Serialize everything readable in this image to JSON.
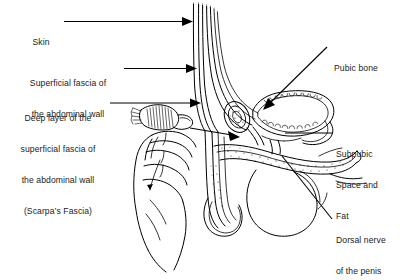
{
  "figure": {
    "style": "black and white line drawing",
    "background_color": "#ffffff",
    "ink_color": "#000000"
  },
  "labels": [
    {
      "id": "skin",
      "text": "Skin",
      "lines": [
        "Skin"
      ],
      "side": "left",
      "leader": "horizontal-arrow"
    },
    {
      "id": "superficial-fascia",
      "text": "Superficial fascia of the abdominal wall",
      "lines": [
        "Superficial fascia of",
        "the abdominal wall"
      ],
      "side": "left",
      "leader": "horizontal-arrow"
    },
    {
      "id": "scarpas-fascia",
      "text": "Deep layer of the superficial fascia of the abdominal wall (Scarpa's Fascia)",
      "lines": [
        "Deep layer of the",
        "superficial fascia of",
        "the abdominal wall",
        "(Scarpa’s Fascia)"
      ],
      "side": "left",
      "leader": "horizontal-arrow"
    },
    {
      "id": "pubic-bone",
      "text": "Pubic bone",
      "lines": [
        "Pubic bone"
      ],
      "side": "right",
      "leader": "diagonal-arrow"
    },
    {
      "id": "subpubic-space",
      "text": "Subpubic Space and Fat",
      "lines": [
        "Subpubic",
        "Space and",
        "Fat"
      ],
      "side": "right",
      "leader": "horizontal-line"
    },
    {
      "id": "dorsal-nerve",
      "text": "Dorsal nerve of the penis",
      "lines": [
        "Dorsal nerve",
        "of the penis"
      ],
      "side": "right",
      "leader": "diagonal-line"
    }
  ],
  "structures": [
    "skin layer",
    "superficial fascia of abdominal wall",
    "deep layer of superficial fascia (Scarpa's fascia)",
    "reflected fascia flap held by hand",
    "pubic bone",
    "subpubic space and fat",
    "corpus cavernosum / penile shaft",
    "scrotum",
    "dorsal nerve of the penis",
    "examining hand"
  ]
}
